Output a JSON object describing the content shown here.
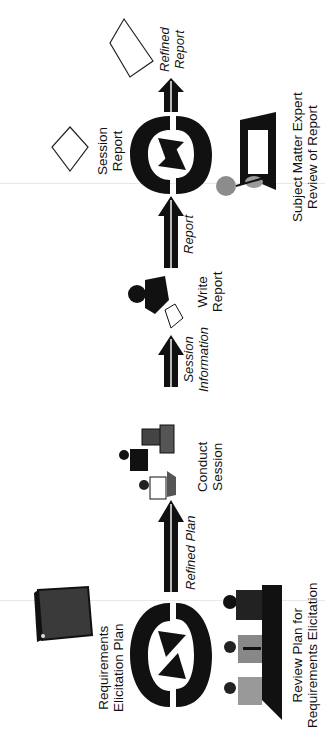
{
  "diagram": {
    "orientation": "rotated-90-ccw",
    "flow": [
      {
        "id": "review-plan",
        "type": "cycle",
        "caption_top": "Requirements\nElicitation Plan",
        "caption_line1": "Requirements",
        "caption_line2": "Elicitation Plan",
        "bottom_line1": "Review Plan for",
        "bottom_line2": "Requirements Elicitation"
      },
      {
        "id": "arrow-refined-plan",
        "type": "arrow",
        "label": "Refined Plan"
      },
      {
        "id": "conduct-session",
        "type": "activity",
        "line1": "Conduct",
        "line2": "Session"
      },
      {
        "id": "arrow-session-info",
        "type": "arrow",
        "line1": "Session",
        "line2": "Information"
      },
      {
        "id": "write-report",
        "type": "activity",
        "line1": "Write",
        "line2": "Report"
      },
      {
        "id": "arrow-report",
        "type": "arrow",
        "label": "Report"
      },
      {
        "id": "sme-review",
        "type": "cycle",
        "caption_line1": "Session",
        "caption_line2": "Report",
        "bottom_line1": "Subject Matter Expert",
        "bottom_line2": "Review of Report"
      },
      {
        "id": "arrow-refined-report",
        "type": "arrow",
        "line1": "Refined",
        "line2": "Report"
      }
    ],
    "colors": {
      "ink": "#111111",
      "gray": "#7a7a7a",
      "paper": "#ffffff"
    }
  }
}
